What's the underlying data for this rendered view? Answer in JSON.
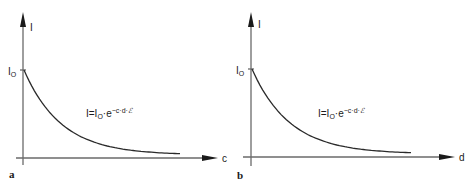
{
  "panels": [
    {
      "id": "a",
      "panel_label": "a",
      "y_axis_label": "I",
      "x_axis_label": "c",
      "y_intercept_label": "I",
      "y_intercept_sub": "O",
      "formula": {
        "lhs": "I=I",
        "sub": "O",
        "mid": "·e",
        "exponent": "−c·d·",
        "epsilon": "ℰ"
      },
      "curve": "exponential decay"
    },
    {
      "id": "b",
      "panel_label": "b",
      "y_axis_label": "I",
      "x_axis_label": "d",
      "y_intercept_label": "I",
      "y_intercept_sub": "O",
      "formula": {
        "lhs": "I=I",
        "sub": "O",
        "mid": "·e",
        "exponent": "−c·d·",
        "epsilon": "ℰ"
      },
      "curve": "exponential decay"
    }
  ]
}
